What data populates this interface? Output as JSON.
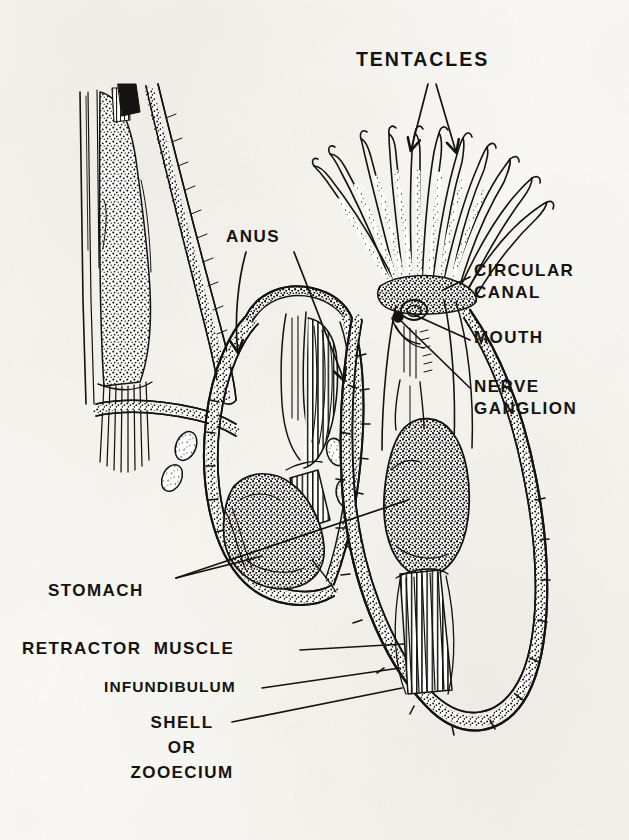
{
  "figure": {
    "ink_color": "#15130f",
    "paper_color": "#fbfaf7",
    "labels": {
      "tentacles": "TENTACLES",
      "anus": "ANUS",
      "circular_canal_line1": "CIRCULAR",
      "circular_canal_line2": "CANAL",
      "mouth": "MOUTH",
      "nerve_line1": "NERVE",
      "nerve_line2": "GANGLION",
      "stomach": "STOMACH",
      "retractor_muscle": "RETRACTOR  MUSCLE",
      "infundibulum": "INFUNDIBULUM",
      "shell_line1": "SHELL",
      "shell_line2": "OR",
      "shell_line3": "ZOOECIUM"
    }
  }
}
